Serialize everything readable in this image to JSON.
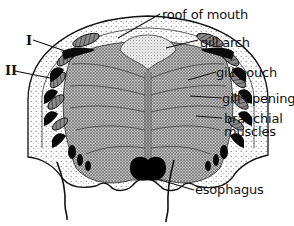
{
  "figure": {
    "labels": {
      "roof_of_mouth": "roof of mouth",
      "gill_arch": "gill arch",
      "gill_pouch": "gill pouch",
      "gill_opening": "gill opening",
      "branchial_muscles_line1": "branchial",
      "branchial_muscles_line2": "muscles",
      "esophagus": "esophagus"
    },
    "roman_numerals": {
      "first": "I",
      "second": "II"
    },
    "colors": {
      "ink": "#111111",
      "background": "#ffffff",
      "stipple_light": "#e8e8e8",
      "stipple_dark": "#9a9a9a"
    }
  }
}
